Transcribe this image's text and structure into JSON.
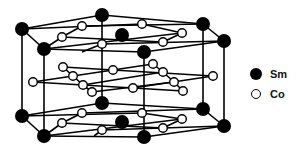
{
  "diagram": {
    "title": "",
    "type": "crystal-structure",
    "colors": {
      "sm": "#000000",
      "co": "#ffffff",
      "stroke": "#000000"
    }
  },
  "legend": {
    "items": [
      {
        "symbol": "filled-circle",
        "label": "Sm"
      },
      {
        "symbol": "open-circle",
        "label": "Co"
      }
    ]
  }
}
